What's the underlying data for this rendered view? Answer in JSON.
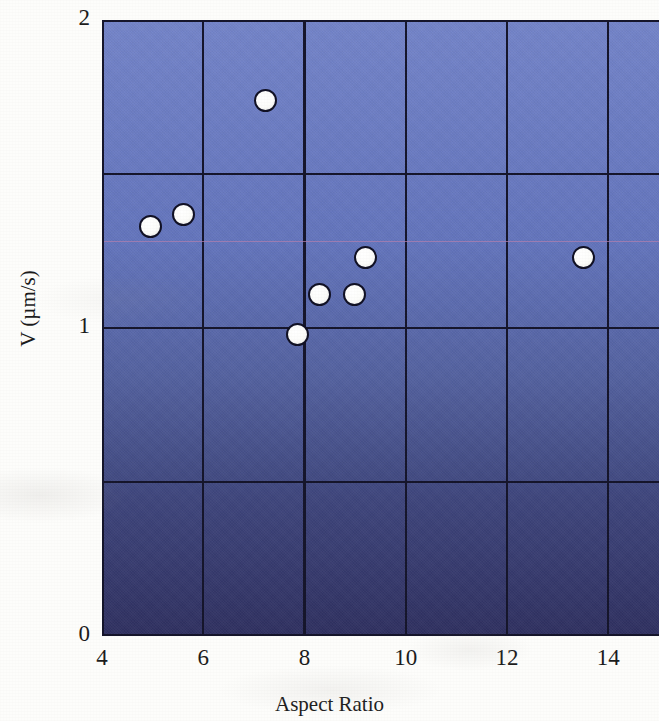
{
  "chart_data": {
    "type": "scatter",
    "title": "",
    "xlabel": "Aspect Ratio",
    "ylabel": "V (µm/s)",
    "xlim": [
      4,
      15
    ],
    "ylim": [
      0,
      2
    ],
    "xticks": [
      "4",
      "6",
      "8",
      "10",
      "12",
      "14"
    ],
    "xtick_values": [
      4,
      6,
      8,
      10,
      12,
      14
    ],
    "yticks": [
      "0",
      "1",
      "2"
    ],
    "ytick_values": [
      0,
      1,
      2
    ],
    "grid": true,
    "legend": null,
    "series": [
      {
        "name": "measurements",
        "marker": "filled-white-circle",
        "marker_face_color": "#ffffff",
        "marker_edge_color": "#101024",
        "points": [
          {
            "x": 4.96,
            "y": 1.33
          },
          {
            "x": 5.61,
            "y": 1.37
          },
          {
            "x": 7.22,
            "y": 1.74
          },
          {
            "x": 7.87,
            "y": 0.98
          },
          {
            "x": 8.3,
            "y": 1.11
          },
          {
            "x": 8.99,
            "y": 1.11
          },
          {
            "x": 9.21,
            "y": 1.23
          },
          {
            "x": 13.51,
            "y": 1.23
          }
        ]
      }
    ],
    "annotations": [
      {
        "type": "horizontal-reference-line",
        "y": 1.28,
        "color": "#b07fae",
        "label": ""
      }
    ],
    "plot_background": {
      "type": "vertical-gradient",
      "top_color": "#7384c9",
      "bottom_color": "#2f3060"
    },
    "gridline_color": "#15152b",
    "axis_color": "#14142a"
  }
}
